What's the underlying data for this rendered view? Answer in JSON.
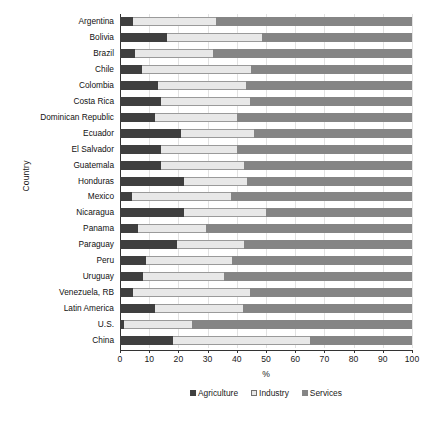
{
  "chart_data": {
    "type": "bar",
    "orientation": "horizontal",
    "stacked": true,
    "normalized": true,
    "title": "",
    "xlabel": "%",
    "ylabel": "Country",
    "xlim": [
      0,
      100
    ],
    "xticks": [
      0,
      10,
      20,
      30,
      40,
      50,
      60,
      70,
      80,
      90,
      100
    ],
    "grid": true,
    "legend_position": "bottom",
    "legend": [
      "Agriculture",
      "Industry",
      "Services"
    ],
    "series": [
      {
        "name": "Agriculture",
        "color": "#3f3f3f",
        "values": [
          4.5,
          16.0,
          5.0,
          7.5,
          13.0,
          14.0,
          12.0,
          21.0,
          14.0,
          14.0,
          22.0,
          4.0,
          22.0,
          6.0,
          19.5,
          9.0,
          8.0,
          4.5,
          12.0,
          1.2,
          18.0
        ]
      },
      {
        "name": "Industry",
        "color": "#e8e8e8",
        "values": [
          28.5,
          32.5,
          27.0,
          37.5,
          30.0,
          30.5,
          28.0,
          25.0,
          26.0,
          28.5,
          21.5,
          34.0,
          28.0,
          23.5,
          23.0,
          29.5,
          27.5,
          40.0,
          30.0,
          23.3,
          47.0
        ]
      },
      {
        "name": "Services",
        "color": "#858585",
        "values": [
          67.0,
          51.5,
          68.0,
          55.0,
          57.0,
          55.5,
          60.0,
          54.0,
          60.0,
          57.5,
          56.5,
          62.0,
          50.0,
          70.5,
          57.5,
          61.5,
          64.5,
          55.5,
          58.0,
          75.5,
          35.0
        ]
      }
    ],
    "categories": [
      "Argentina",
      "Bolivia",
      "Brazil",
      "Chile",
      "Colombia",
      "Costa Rica",
      "Dominican Republic",
      "Ecuador",
      "El Salvador",
      "Guatemala",
      "Honduras",
      "Mexico",
      "Nicaragua",
      "Panama",
      "Paraguay",
      "Peru",
      "Uruguay",
      "Venezuela, RB",
      "Latin America",
      "U.S.",
      "China"
    ]
  },
  "caption": ""
}
